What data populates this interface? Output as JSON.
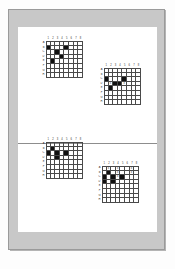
{
  "document": {
    "kind": "scanned-page",
    "frame_color": "#c8c8c8",
    "page_color": "#ffffff",
    "divider_color": "#8d8d8d",
    "filled_cell_color": "#101010",
    "grid_line_color": "#4a4a4a"
  },
  "puzzles": [
    {
      "id": "puzzle-top-left",
      "cols": 8,
      "rows": 8,
      "col_labels": [
        "1",
        "2",
        "3",
        "4",
        "5",
        "6",
        "7",
        "8"
      ],
      "row_labels": [
        "A",
        "B",
        "C",
        "D",
        "E",
        "F",
        "G",
        "H"
      ],
      "filled": [
        {
          "r": 2,
          "c": 1
        },
        {
          "r": 2,
          "c": 5
        },
        {
          "r": 3,
          "c": 3
        },
        {
          "r": 4,
          "c": 4
        },
        {
          "r": 5,
          "c": 2
        }
      ],
      "marks": []
    },
    {
      "id": "puzzle-top-right",
      "cols": 8,
      "rows": 8,
      "col_labels": [
        "1",
        "2",
        "3",
        "4",
        "5",
        "6",
        "7",
        "8"
      ],
      "row_labels": [
        "A",
        "B",
        "C",
        "D",
        "E",
        "F",
        "G",
        "H"
      ],
      "filled": [
        {
          "r": 3,
          "c": 1
        },
        {
          "r": 3,
          "c": 5
        },
        {
          "r": 4,
          "c": 3
        },
        {
          "r": 4,
          "c": 4
        },
        {
          "r": 5,
          "c": 2
        }
      ],
      "marks": [
        {
          "r": 4,
          "c": 2,
          "t": "x"
        },
        {
          "r": 4,
          "c": 5,
          "t": "x"
        }
      ]
    },
    {
      "id": "puzzle-bottom-left",
      "cols": 8,
      "rows": 8,
      "col_labels": [
        "1",
        "2",
        "3",
        "4",
        "5",
        "6",
        "7",
        "8"
      ],
      "row_labels": [
        "A",
        "B",
        "C",
        "D",
        "E",
        "F",
        "G",
        "H"
      ],
      "filled": [
        {
          "r": 2,
          "c": 2
        },
        {
          "r": 3,
          "c": 1
        },
        {
          "r": 3,
          "c": 3
        },
        {
          "r": 3,
          "c": 5
        },
        {
          "r": 4,
          "c": 3
        }
      ],
      "marks": []
    },
    {
      "id": "puzzle-bottom-right",
      "cols": 8,
      "rows": 8,
      "col_labels": [
        "1",
        "2",
        "3",
        "4",
        "5",
        "6",
        "7",
        "8"
      ],
      "row_labels": [
        "A",
        "B",
        "C",
        "D",
        "E",
        "F",
        "G",
        "H"
      ],
      "filled": [
        {
          "r": 2,
          "c": 2
        },
        {
          "r": 3,
          "c": 1
        },
        {
          "r": 3,
          "c": 3
        },
        {
          "r": 3,
          "c": 5
        },
        {
          "r": 4,
          "c": 1
        },
        {
          "r": 4,
          "c": 3
        }
      ],
      "marks": [
        {
          "r": 1,
          "c": 2,
          "t": "x"
        },
        {
          "r": 1,
          "c": 4,
          "t": "x"
        },
        {
          "r": 1,
          "c": 7,
          "t": "x"
        },
        {
          "r": 2,
          "c": 4,
          "t": "x"
        },
        {
          "r": 2,
          "c": 7,
          "t": "x"
        },
        {
          "r": 3,
          "c": 4,
          "t": "x"
        }
      ]
    }
  ]
}
